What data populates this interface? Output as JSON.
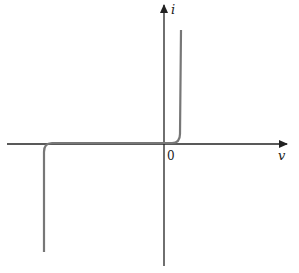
{
  "diagram": {
    "title": "",
    "axes": {
      "x_label": "v",
      "y_label": "i",
      "origin_label": "0"
    },
    "curve": {
      "description": "Diode I-V characteristic with reverse breakdown",
      "color": "#777777",
      "axis_color": "#222222"
    }
  }
}
